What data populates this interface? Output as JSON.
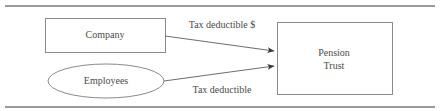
{
  "diagram": {
    "colors": {
      "shape_stroke": "#8a8a8a",
      "edge_stroke": "#6e6e6e",
      "text": "#4a4a4a",
      "rule": "#9a9a9a",
      "background": "#ffffff"
    },
    "rules": [
      {
        "name": "top-rule",
        "x1": 5,
        "y1": 6,
        "x2": 435,
        "y2": 6
      },
      {
        "name": "bottom-rule",
        "x1": 5,
        "y1": 107,
        "x2": 435,
        "y2": 107
      }
    ],
    "nodes": [
      {
        "id": "company",
        "shape": "rectangle",
        "label": "Company",
        "x": 45,
        "y": 18,
        "width": 120,
        "height": 34,
        "label_x": 105,
        "label_y": 35
      },
      {
        "id": "employees",
        "shape": "ellipse",
        "label": "Employees",
        "cx": 106,
        "cy": 81,
        "rx": 58,
        "ry": 17,
        "label_x": 106,
        "label_y": 81
      },
      {
        "id": "pension-trust",
        "shape": "rectangle",
        "label_line1": "Pension",
        "label_line2": "Trust",
        "x": 277,
        "y": 22,
        "width": 115,
        "height": 73,
        "label_x": 334,
        "label_y1": 53,
        "label_y2": 66
      }
    ],
    "edges": [
      {
        "id": "company-to-trust",
        "from": "company",
        "to": "pension-trust",
        "label": "Tax deductible $",
        "x1": 165,
        "y1": 36,
        "x2": 275,
        "y2": 51,
        "label_x": 222,
        "label_y": 26
      },
      {
        "id": "employees-to-trust",
        "from": "employees",
        "to": "pension-trust",
        "label": "Tax deductible",
        "x1": 164,
        "y1": 81,
        "x2": 275,
        "y2": 66,
        "label_x": 222,
        "label_y": 90
      }
    ]
  }
}
